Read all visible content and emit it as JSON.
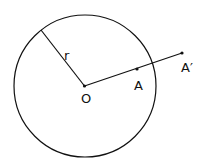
{
  "diagram": {
    "circle": {
      "cx": 85,
      "cy": 86,
      "r": 71,
      "stroke": "#111111"
    },
    "center": {
      "label": "O",
      "x": 84.5,
      "y": 86
    },
    "radius": {
      "label": "r",
      "x1": 41,
      "y1": 30,
      "x2": 84.5,
      "y2": 86
    },
    "point_a": {
      "label": "A",
      "x": 137,
      "y": 69
    },
    "point_a_prime": {
      "label": "A′",
      "x": 182,
      "y": 53
    }
  }
}
